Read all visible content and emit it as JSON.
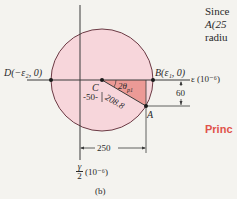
{
  "figure": {
    "caption": "(b)",
    "colors": {
      "background": "#f4f3ef",
      "circle_fill": "#f7d6db",
      "circle_stroke": "#6b3a44",
      "triangle_fill": "#ec9a96",
      "axis": "#3a3a3a",
      "accent_red": "#e0524a"
    },
    "axes": {
      "horizontal_label": "ε (10⁻⁶)",
      "vertical_label_num": "γ",
      "vertical_label_den": "2",
      "vertical_label_unit": "(10⁻⁶)"
    },
    "points": {
      "D": "D(−ε₂, 0)",
      "B": "B(ε₁, 0)",
      "C": "C",
      "A": "A"
    },
    "dimensions": {
      "center_offset": "50",
      "radius": "208.8",
      "x_of_A": "250",
      "y_of_A": "60",
      "angle": "2θ",
      "angle_subscript": "p1"
    }
  },
  "side_text": {
    "line1": "Since",
    "line2": "A(25",
    "line3": "radiu",
    "heading": "Princ"
  }
}
